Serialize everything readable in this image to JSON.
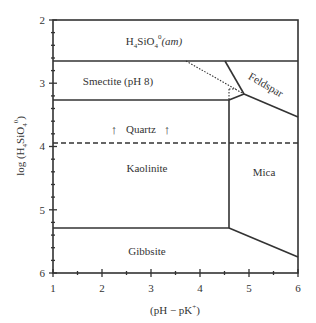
{
  "diagram": {
    "type": "stability-field-diagram",
    "xlabel": "(pH − pK",
    "xlabel_sup": "+",
    "xlabel_close": ")",
    "ylabel_prefix": "log (H",
    "ylabel_sub4": "4",
    "ylabel_mid": "SiO",
    "ylabel_sub4b": "4",
    "ylabel_sup0": "0",
    "ylabel_close": ")",
    "x_ticks": [
      "1",
      "2",
      "3",
      "4",
      "5",
      "6"
    ],
    "y_ticks": [
      "2",
      "3",
      "4",
      "5",
      "6"
    ],
    "xlim": [
      1,
      6
    ],
    "ylim": [
      2,
      6
    ],
    "fields": {
      "amorphous_silica": {
        "pre": "H",
        "sub1": "4",
        "mid": "SiO",
        "sub2": "4",
        "sup": "0",
        "italic": "(am)"
      },
      "smectite": "Smectite (pH 8)",
      "feldspar": "Feldspar",
      "quartz": "Quartz",
      "quartz_arrow": "↑",
      "kaolinite": "Kaolinite",
      "mica": "Mica",
      "gibbsite": "Gibbsite"
    }
  }
}
